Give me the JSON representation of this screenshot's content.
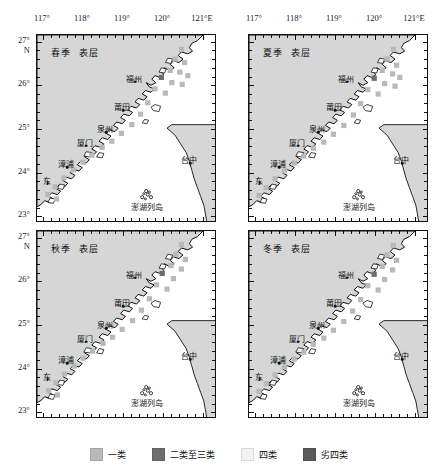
{
  "figure": {
    "width": 438,
    "height": 471,
    "type": "map-grid"
  },
  "axes": {
    "x_unit": "E",
    "y_unit": "N",
    "x_ticks": [
      "117°",
      "118°",
      "119°",
      "120°",
      "121°"
    ],
    "x_last_label": "121°E",
    "y_ticks": [
      "27°",
      "26°",
      "25°",
      "24°",
      "23°"
    ],
    "y_first_label_unit": "N",
    "xlim": [
      116.85,
      121.35
    ],
    "ylim": [
      22.85,
      27.15
    ],
    "minor_tick_step": 0.2,
    "major_tick_step": 1.0,
    "grid": false
  },
  "panels": [
    {
      "id": "spring-surface",
      "season": "春季",
      "layer": "表层",
      "row": 0,
      "col": 0
    },
    {
      "id": "summer-surface",
      "season": "夏季",
      "layer": "表层",
      "row": 0,
      "col": 1
    },
    {
      "id": "autumn-surface",
      "season": "秋季",
      "layer": "表层",
      "row": 1,
      "col": 0
    },
    {
      "id": "winter-surface",
      "season": "冬季",
      "layer": "表层",
      "row": 1,
      "col": 1
    }
  ],
  "places": [
    {
      "name": "福州",
      "lon": 119.3,
      "lat": 26.08,
      "dx": -1,
      "dy": -9
    },
    {
      "name": "莆田",
      "lon": 119.0,
      "lat": 25.43,
      "dx": -1,
      "dy": -9
    },
    {
      "name": "泉州",
      "lon": 118.58,
      "lat": 24.92,
      "dx": -1,
      "dy": -9
    },
    {
      "name": "厦门",
      "lon": 118.08,
      "lat": 24.62,
      "dx": -1,
      "dy": -9
    },
    {
      "name": "漳浦",
      "lon": 117.6,
      "lat": 24.13,
      "dx": -1,
      "dy": -9
    },
    {
      "name": "东",
      "lon": 117.12,
      "lat": 23.76,
      "dx": -1,
      "dy": -8
    },
    {
      "name": "台中",
      "lon": 120.68,
      "lat": 24.22,
      "dx": -1,
      "dy": -9
    },
    {
      "name": "澎湖列岛",
      "lon": 119.62,
      "lat": 23.35,
      "dx": -1,
      "dy": 0
    }
  ],
  "legend": {
    "position": "bottom-center",
    "items": [
      {
        "label": "一类",
        "color": "#b9b9b9",
        "class_code": "I"
      },
      {
        "label": "二类至三类",
        "color": "#6e6e6e",
        "class_code": "II-III"
      },
      {
        "label": "四类",
        "color": "#f2f2f2",
        "class_code": "IV"
      },
      {
        "label": "劣四类",
        "color": "#5a5a5a",
        "class_code": "worse-than-IV"
      }
    ]
  },
  "colors": {
    "land": "#d6d6d6",
    "sea": "#ffffff",
    "coastline": "#111111",
    "frame": "#111111",
    "class_I": "#b9b9b9",
    "class_II_III": "#6e6e6e",
    "class_IV": "#f2f2f2",
    "class_worse_IV": "#5a5a5a"
  },
  "chart_data": {
    "type": "heatmap",
    "title": "",
    "subtitle": "",
    "xlabel": "Longitude (°E)",
    "ylabel": "Latitude (°N)",
    "xlim": [
      116.85,
      121.35
    ],
    "ylim": [
      22.85,
      27.15
    ],
    "grid": false,
    "legend_position": "bottom",
    "categories": [
      "一类",
      "二类至三类",
      "四类",
      "劣四类"
    ],
    "category_colors": [
      "#b9b9b9",
      "#6e6e6e",
      "#f2f2f2",
      "#5a5a5a"
    ],
    "series": [
      {
        "name": "春季 表层",
        "points": [
          {
            "lon": 120.46,
            "lat": 26.82,
            "class": "一类"
          },
          {
            "lon": 120.3,
            "lat": 26.6,
            "class": "一类"
          },
          {
            "lon": 120.54,
            "lat": 26.52,
            "class": "一类"
          },
          {
            "lon": 120.18,
            "lat": 26.34,
            "class": "一类"
          },
          {
            "lon": 120.42,
            "lat": 26.3,
            "class": "一类"
          },
          {
            "lon": 120.62,
            "lat": 26.22,
            "class": "一类"
          },
          {
            "lon": 119.96,
            "lat": 26.18,
            "class": "二类至三类"
          },
          {
            "lon": 120.22,
            "lat": 26.06,
            "class": "一类"
          },
          {
            "lon": 120.48,
            "lat": 26.02,
            "class": "一类"
          },
          {
            "lon": 119.8,
            "lat": 25.92,
            "class": "一类"
          },
          {
            "lon": 120.06,
            "lat": 25.82,
            "class": "一类"
          },
          {
            "lon": 119.62,
            "lat": 25.6,
            "class": "一类"
          },
          {
            "lon": 119.44,
            "lat": 25.34,
            "class": "一类"
          },
          {
            "lon": 119.22,
            "lat": 25.1,
            "class": "一类"
          },
          {
            "lon": 118.96,
            "lat": 24.9,
            "class": "一类"
          },
          {
            "lon": 118.72,
            "lat": 24.72,
            "class": "一类"
          },
          {
            "lon": 118.48,
            "lat": 24.58,
            "class": "一类"
          },
          {
            "lon": 118.22,
            "lat": 24.4,
            "class": "一类"
          },
          {
            "lon": 118.0,
            "lat": 24.24,
            "class": "一类"
          },
          {
            "lon": 117.76,
            "lat": 24.06,
            "class": "一类"
          },
          {
            "lon": 117.52,
            "lat": 23.88,
            "class": "一类"
          },
          {
            "lon": 117.3,
            "lat": 23.68,
            "class": "一类"
          },
          {
            "lon": 117.12,
            "lat": 23.5,
            "class": "一类"
          },
          {
            "lon": 117.34,
            "lat": 23.4,
            "class": "一类"
          }
        ]
      },
      {
        "name": "夏季 表层",
        "points": [
          {
            "lon": 120.46,
            "lat": 26.82,
            "class": "一类"
          },
          {
            "lon": 120.3,
            "lat": 26.6,
            "class": "一类"
          },
          {
            "lon": 120.54,
            "lat": 26.46,
            "class": "一类"
          },
          {
            "lon": 120.18,
            "lat": 26.34,
            "class": "一类"
          },
          {
            "lon": 120.44,
            "lat": 26.26,
            "class": "一类"
          },
          {
            "lon": 120.62,
            "lat": 26.18,
            "class": "一类"
          },
          {
            "lon": 119.98,
            "lat": 26.16,
            "class": "二类至三类"
          },
          {
            "lon": 120.24,
            "lat": 26.04,
            "class": "一类"
          },
          {
            "lon": 120.5,
            "lat": 25.98,
            "class": "一类"
          },
          {
            "lon": 119.82,
            "lat": 25.9,
            "class": "一类"
          },
          {
            "lon": 120.08,
            "lat": 25.8,
            "class": "一类"
          },
          {
            "lon": 119.64,
            "lat": 25.58,
            "class": "一类"
          },
          {
            "lon": 119.46,
            "lat": 25.32,
            "class": "一类"
          },
          {
            "lon": 119.22,
            "lat": 25.08,
            "class": "一类"
          },
          {
            "lon": 118.96,
            "lat": 24.88,
            "class": "一类"
          },
          {
            "lon": 118.72,
            "lat": 24.7,
            "class": "一类"
          },
          {
            "lon": 118.46,
            "lat": 24.56,
            "class": "一类"
          },
          {
            "lon": 118.22,
            "lat": 24.38,
            "class": "一类"
          },
          {
            "lon": 117.98,
            "lat": 24.22,
            "class": "一类"
          },
          {
            "lon": 117.74,
            "lat": 24.04,
            "class": "一类"
          },
          {
            "lon": 117.5,
            "lat": 23.86,
            "class": "一类"
          },
          {
            "lon": 117.28,
            "lat": 23.66,
            "class": "一类"
          },
          {
            "lon": 117.1,
            "lat": 23.48,
            "class": "一类"
          }
        ]
      },
      {
        "name": "秋季 表层",
        "points": [
          {
            "lon": 120.46,
            "lat": 26.84,
            "class": "一类"
          },
          {
            "lon": 120.32,
            "lat": 26.62,
            "class": "一类"
          },
          {
            "lon": 120.56,
            "lat": 26.5,
            "class": "一类"
          },
          {
            "lon": 120.2,
            "lat": 26.36,
            "class": "一类"
          },
          {
            "lon": 120.46,
            "lat": 26.28,
            "class": "一类"
          },
          {
            "lon": 119.98,
            "lat": 26.18,
            "class": "二类至三类"
          },
          {
            "lon": 120.26,
            "lat": 26.06,
            "class": "一类"
          },
          {
            "lon": 119.84,
            "lat": 25.92,
            "class": "一类"
          },
          {
            "lon": 120.1,
            "lat": 25.82,
            "class": "一类"
          },
          {
            "lon": 119.66,
            "lat": 25.6,
            "class": "一类"
          },
          {
            "lon": 119.46,
            "lat": 25.34,
            "class": "一类"
          },
          {
            "lon": 119.24,
            "lat": 25.1,
            "class": "一类"
          },
          {
            "lon": 118.98,
            "lat": 24.9,
            "class": "一类"
          },
          {
            "lon": 118.74,
            "lat": 24.72,
            "class": "一类"
          },
          {
            "lon": 118.5,
            "lat": 24.58,
            "class": "一类"
          },
          {
            "lon": 118.24,
            "lat": 24.4,
            "class": "一类"
          },
          {
            "lon": 118.0,
            "lat": 24.24,
            "class": "一类"
          },
          {
            "lon": 117.78,
            "lat": 24.06,
            "class": "一类"
          },
          {
            "lon": 117.54,
            "lat": 23.88,
            "class": "一类"
          },
          {
            "lon": 117.32,
            "lat": 23.68,
            "class": "一类"
          },
          {
            "lon": 117.14,
            "lat": 23.5,
            "class": "一类"
          },
          {
            "lon": 117.36,
            "lat": 23.4,
            "class": "一类"
          }
        ]
      },
      {
        "name": "冬季 表层",
        "points": [
          {
            "lon": 120.46,
            "lat": 26.82,
            "class": "一类"
          },
          {
            "lon": 120.3,
            "lat": 26.6,
            "class": "一类"
          },
          {
            "lon": 120.54,
            "lat": 26.48,
            "class": "一类"
          },
          {
            "lon": 120.18,
            "lat": 26.34,
            "class": "一类"
          },
          {
            "lon": 120.44,
            "lat": 26.26,
            "class": "一类"
          },
          {
            "lon": 119.98,
            "lat": 26.16,
            "class": "二类至三类"
          },
          {
            "lon": 120.24,
            "lat": 26.04,
            "class": "一类"
          },
          {
            "lon": 119.82,
            "lat": 25.9,
            "class": "一类"
          },
          {
            "lon": 120.08,
            "lat": 25.8,
            "class": "一类"
          },
          {
            "lon": 119.64,
            "lat": 25.58,
            "class": "一类"
          },
          {
            "lon": 119.44,
            "lat": 25.32,
            "class": "一类"
          },
          {
            "lon": 119.22,
            "lat": 25.08,
            "class": "一类"
          },
          {
            "lon": 118.96,
            "lat": 24.88,
            "class": "一类"
          },
          {
            "lon": 118.72,
            "lat": 24.7,
            "class": "一类"
          },
          {
            "lon": 118.46,
            "lat": 24.56,
            "class": "一类"
          },
          {
            "lon": 118.22,
            "lat": 24.38,
            "class": "一类"
          },
          {
            "lon": 117.98,
            "lat": 24.22,
            "class": "一类"
          },
          {
            "lon": 117.74,
            "lat": 24.04,
            "class": "一类"
          },
          {
            "lon": 117.5,
            "lat": 23.86,
            "class": "一类"
          },
          {
            "lon": 117.28,
            "lat": 23.66,
            "class": "一类"
          },
          {
            "lon": 117.1,
            "lat": 23.48,
            "class": "一类"
          }
        ]
      }
    ]
  }
}
